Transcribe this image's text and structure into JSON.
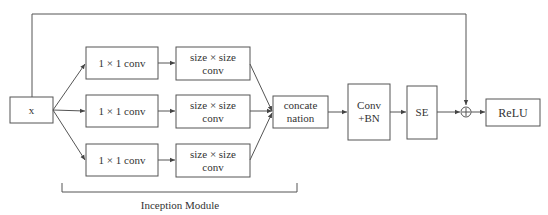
{
  "diagram": {
    "input": {
      "label": "x"
    },
    "branches": [
      {
        "reduce": "1 × 1 conv",
        "conv_line1": "size × size",
        "conv_line2": "conv"
      },
      {
        "reduce": "1 × 1 conv",
        "conv_line1": "size × size",
        "conv_line2": "conv"
      },
      {
        "reduce": "1 × 1 conv",
        "conv_line1": "size × size",
        "conv_line2": "conv"
      }
    ],
    "concat": {
      "line1": "concate",
      "line2": "nation"
    },
    "conv_bn": {
      "line1": "Conv",
      "line2": "+BN"
    },
    "se": {
      "label": "SE"
    },
    "add": {
      "symbol": "+"
    },
    "relu": {
      "label": "ReLU"
    },
    "module_label": "Inception Module",
    "colors": {
      "stroke": "#555555",
      "text": "#333333",
      "background": "#ffffff"
    }
  }
}
